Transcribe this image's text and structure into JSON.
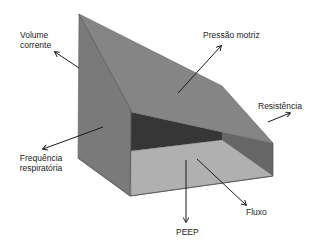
{
  "diagram": {
    "type": "3d-prism-ventilation-energy",
    "colors": {
      "back_left_face": "#7d7d7d",
      "top_slope_face": "#858585",
      "inner_dark_face": "#3a3a3a",
      "inner_right_face": "#6a6a6a",
      "floor_face": "#b9b9b9",
      "front_glass_face": "#a8a8a8",
      "right_face": "#8a8a8a",
      "edge": "#555555",
      "arrow": "#1a1a1a",
      "text": "#222222"
    },
    "labels": {
      "volume_line1": "Volume",
      "volume_line2": "corrente",
      "pressure": "Pressão motriz",
      "resistance": "Resistência",
      "frequency_line1": "Frequência",
      "frequency_line2": "respiratória",
      "peep": "PEEP",
      "flow": "Fluxo"
    }
  }
}
